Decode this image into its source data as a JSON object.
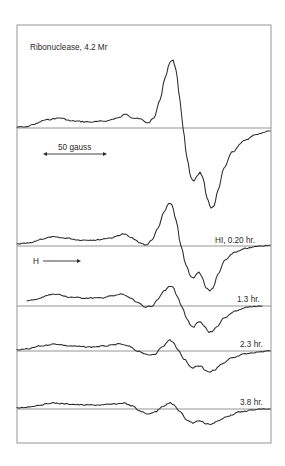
{
  "chart_data": {
    "type": "line",
    "title": "Ribonuclease, 4.2 Mr",
    "xlabel": "H",
    "ylabel": "",
    "scale_bar": "50 gauss",
    "field_direction_label": "H",
    "grid": false,
    "legend": "none (traces labeled inline at right)",
    "series": [
      {
        "name": "Ribonuclease, 4.2 Mr",
        "label": "",
        "baseline_y": 128,
        "points": [
          [
            17,
            127
          ],
          [
            25,
            127
          ],
          [
            35,
            124
          ],
          [
            45,
            120
          ],
          [
            60,
            118
          ],
          [
            72,
            121
          ],
          [
            90,
            122
          ],
          [
            105,
            121
          ],
          [
            118,
            118
          ],
          [
            126,
            114
          ],
          [
            133,
            118
          ],
          [
            140,
            119
          ],
          [
            148,
            123
          ],
          [
            154,
            118
          ],
          [
            160,
            100
          ],
          [
            165,
            78
          ],
          [
            170,
            62
          ],
          [
            173,
            60
          ],
          [
            176,
            70
          ],
          [
            180,
            100
          ],
          [
            183,
            128
          ],
          [
            187,
            158
          ],
          [
            191,
            178
          ],
          [
            194,
            181
          ],
          [
            197,
            176
          ],
          [
            200,
            172
          ],
          [
            203,
            178
          ],
          [
            207,
            198
          ],
          [
            211,
            208
          ],
          [
            214,
            206
          ],
          [
            218,
            190
          ],
          [
            224,
            168
          ],
          [
            232,
            152
          ],
          [
            245,
            140
          ],
          [
            258,
            134
          ],
          [
            270,
            131
          ]
        ]
      },
      {
        "name": "HI, 0.20 hr.",
        "label": "HI, 0.20 hr.",
        "baseline_y": 246,
        "points": [
          [
            17,
            244
          ],
          [
            30,
            243
          ],
          [
            42,
            239
          ],
          [
            52,
            237
          ],
          [
            65,
            238
          ],
          [
            80,
            240
          ],
          [
            95,
            240
          ],
          [
            110,
            238
          ],
          [
            124,
            234
          ],
          [
            132,
            238
          ],
          [
            140,
            243
          ],
          [
            146,
            245
          ],
          [
            152,
            240
          ],
          [
            158,
            228
          ],
          [
            164,
            212
          ],
          [
            169,
            203
          ],
          [
            172,
            205
          ],
          [
            176,
            220
          ],
          [
            181,
            246
          ],
          [
            186,
            265
          ],
          [
            191,
            277
          ],
          [
            194,
            278
          ],
          [
            197,
            273
          ],
          [
            199,
            272
          ],
          [
            202,
            277
          ],
          [
            206,
            288
          ],
          [
            210,
            291
          ],
          [
            213,
            288
          ],
          [
            218,
            274
          ],
          [
            225,
            260
          ],
          [
            235,
            252
          ],
          [
            248,
            248
          ],
          [
            260,
            246
          ],
          [
            270,
            245
          ]
        ]
      },
      {
        "name": "1.3 hr.",
        "label": "1.3 hr.",
        "baseline_y": 306,
        "points": [
          [
            27,
            301
          ],
          [
            38,
            299
          ],
          [
            48,
            295
          ],
          [
            56,
            294
          ],
          [
            68,
            297
          ],
          [
            85,
            298
          ],
          [
            100,
            298
          ],
          [
            112,
            296
          ],
          [
            122,
            294
          ],
          [
            130,
            298
          ],
          [
            138,
            303
          ],
          [
            146,
            307
          ],
          [
            152,
            306
          ],
          [
            158,
            299
          ],
          [
            164,
            291
          ],
          [
            170,
            286
          ],
          [
            173,
            287
          ],
          [
            177,
            296
          ],
          [
            182,
            307
          ],
          [
            187,
            319
          ],
          [
            191,
            326
          ],
          [
            194,
            327
          ],
          [
            197,
            323
          ],
          [
            200,
            322
          ],
          [
            204,
            326
          ],
          [
            209,
            332
          ],
          [
            212,
            332
          ],
          [
            217,
            327
          ],
          [
            224,
            318
          ],
          [
            235,
            311
          ],
          [
            248,
            307
          ],
          [
            262,
            306
          ]
        ]
      },
      {
        "name": "2.3 hr.",
        "label": "2.3 hr.",
        "baseline_y": 351,
        "points": [
          [
            17,
            350
          ],
          [
            28,
            349
          ],
          [
            40,
            346
          ],
          [
            55,
            344
          ],
          [
            70,
            346
          ],
          [
            90,
            347
          ],
          [
            105,
            346
          ],
          [
            120,
            344
          ],
          [
            128,
            346
          ],
          [
            138,
            351
          ],
          [
            148,
            355
          ],
          [
            155,
            354
          ],
          [
            162,
            347
          ],
          [
            170,
            340
          ],
          [
            173,
            342
          ],
          [
            178,
            350
          ],
          [
            184,
            359
          ],
          [
            190,
            366
          ],
          [
            193,
            368
          ],
          [
            197,
            366
          ],
          [
            201,
            366
          ],
          [
            205,
            370
          ],
          [
            210,
            372
          ],
          [
            214,
            370
          ],
          [
            222,
            364
          ],
          [
            232,
            358
          ],
          [
            245,
            354
          ],
          [
            258,
            352
          ],
          [
            270,
            351
          ]
        ]
      },
      {
        "name": "3.8 hr.",
        "label": "3.8 hr.",
        "baseline_y": 409,
        "points": [
          [
            17,
            408
          ],
          [
            28,
            407
          ],
          [
            40,
            405
          ],
          [
            52,
            403
          ],
          [
            66,
            404
          ],
          [
            85,
            405
          ],
          [
            100,
            405
          ],
          [
            115,
            404
          ],
          [
            124,
            403
          ],
          [
            132,
            406
          ],
          [
            140,
            411
          ],
          [
            147,
            414
          ],
          [
            155,
            412
          ],
          [
            163,
            406
          ],
          [
            170,
            403
          ],
          [
            174,
            405
          ],
          [
            180,
            412
          ],
          [
            187,
            420
          ],
          [
            193,
            423
          ],
          [
            197,
            421
          ],
          [
            201,
            421
          ],
          [
            206,
            424
          ],
          [
            211,
            424
          ],
          [
            218,
            421
          ],
          [
            228,
            416
          ],
          [
            240,
            412
          ],
          [
            252,
            410
          ],
          [
            262,
            409
          ],
          [
            270,
            409
          ]
        ]
      }
    ],
    "frame": {
      "x": 17,
      "y": 25,
      "width": 254,
      "height": 418
    }
  },
  "labels": {
    "title": "Ribonuclease, 4.2 Mr",
    "scale_bar": "50 gauss",
    "field_arrow": "H",
    "trace2": "HI, 0.20 hr.",
    "trace3": "1.3 hr.",
    "trace4": "2.3 hr.",
    "trace5": "3.8 hr."
  }
}
